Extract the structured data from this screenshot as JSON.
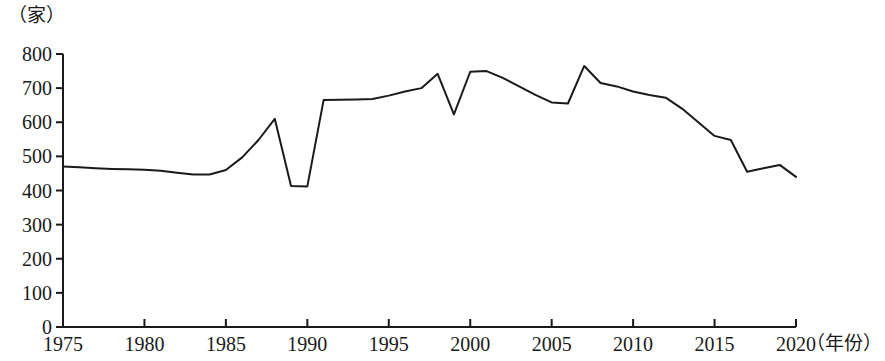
{
  "chart_data": {
    "type": "line",
    "title": "",
    "subtitle": "",
    "xlabel": "（年份）",
    "ylabel": "（家）",
    "ylim": [
      0,
      800
    ],
    "xlim": [
      1975,
      2020
    ],
    "grid": false,
    "legend": false,
    "legend_position": "none",
    "y_ticks": [
      0,
      100,
      200,
      300,
      400,
      500,
      600,
      700,
      800
    ],
    "y_tick_labels": [
      "0",
      "100",
      "200",
      "300",
      "400",
      "500",
      "600",
      "700",
      "800"
    ],
    "x_ticks": [
      1975,
      1980,
      1985,
      1990,
      1995,
      2000,
      2005,
      2010,
      2015,
      2020
    ],
    "x_tick_labels": [
      "1975",
      "1980",
      "1985",
      "1990",
      "1995",
      "2000",
      "2005",
      "2010",
      "2015",
      "2020"
    ],
    "line_color": "#1a1a1a",
    "line_width": 2,
    "markers": false,
    "series": [
      {
        "name": "",
        "x": [
          1975,
          1976,
          1977,
          1978,
          1979,
          1980,
          1981,
          1982,
          1983,
          1984,
          1985,
          1986,
          1987,
          1988,
          1989,
          1990,
          1991,
          1992,
          1993,
          1994,
          1995,
          1996,
          1997,
          1998,
          1999,
          2000,
          2001,
          2002,
          2003,
          2004,
          2005,
          2006,
          2007,
          2008,
          2009,
          2010,
          2011,
          2012,
          2013,
          2014,
          2015,
          2016,
          2017,
          2018,
          2019,
          2020
        ],
        "values": [
          470,
          468,
          465,
          463,
          462,
          461,
          458,
          452,
          447,
          447,
          460,
          497,
          548,
          610,
          413,
          412,
          665,
          666,
          667,
          668,
          678,
          690,
          700,
          742,
          623,
          748,
          750,
          730,
          705,
          680,
          658,
          655,
          765,
          715,
          705,
          690,
          680,
          672,
          640,
          600,
          560,
          548,
          455,
          465,
          475,
          440
        ]
      }
    ],
    "annotations": []
  },
  "axis": {
    "unit_label": "（家）",
    "x_title": "（年份）"
  }
}
